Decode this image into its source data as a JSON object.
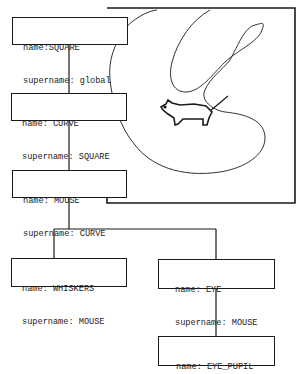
{
  "diagram": {
    "type": "hierarchy-tree",
    "colors": {
      "ink": "#1a1a1a",
      "background": "#ffffff"
    },
    "nodes": [
      {
        "id": "square",
        "name_label": "name:SQUARE",
        "supername_label": "supername: global"
      },
      {
        "id": "curve",
        "name_label": "name: CURVE",
        "supername_label": "supername: SQUARE"
      },
      {
        "id": "mouse",
        "name_label": "name: MOUSE",
        "supername_label": "supername: CURVE"
      },
      {
        "id": "whiskers",
        "name_label": "name: WHISKERS",
        "supername_label": "supername: MOUSE"
      },
      {
        "id": "eye",
        "name_label": "name: EYE",
        "supername_label": "supername: MOUSE"
      },
      {
        "id": "eye_pupil",
        "name_label": "name: EYE_PUPIL",
        "supername_label": "supername: EYE"
      }
    ],
    "edges": [
      {
        "from": "square",
        "to": "curve"
      },
      {
        "from": "curve",
        "to": "mouse"
      },
      {
        "from": "mouse",
        "to": "whiskers"
      },
      {
        "from": "mouse",
        "to": "eye"
      },
      {
        "from": "eye",
        "to": "eye_pupil"
      }
    ],
    "illustration": {
      "frame": "square",
      "contents": [
        "closed-curve",
        "mouse-figure"
      ]
    }
  }
}
